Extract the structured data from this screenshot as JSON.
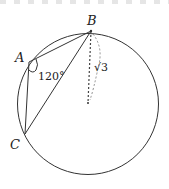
{
  "diagram": {
    "type": "geometry",
    "points": {
      "A": {
        "label": "A",
        "x": 29,
        "y": 62
      },
      "B": {
        "label": "B",
        "x": 91,
        "y": 31
      },
      "C": {
        "label": "C",
        "x": 25,
        "y": 134
      },
      "O": {
        "label": "",
        "x": 88,
        "y": 103
      }
    },
    "angle_label": "120°",
    "radius_label": "√3",
    "colors": {
      "stroke": "#333333",
      "dashed": "#555555",
      "background": "#ffffff"
    }
  }
}
